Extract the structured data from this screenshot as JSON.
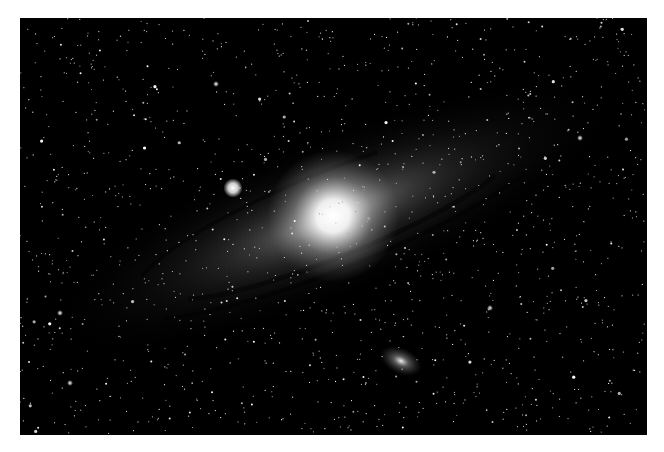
{
  "image": {
    "subject": "Andromeda Galaxy (M31) with satellite galaxies M32 and M110",
    "frame": {
      "x": 20,
      "y": 18,
      "width": 627,
      "height": 417,
      "background": "#ffffff",
      "sky": "#000000"
    },
    "galaxy": {
      "center": [
        313,
        198
      ],
      "angle_deg": -22,
      "core_radius": 22,
      "disk_rx": 300,
      "disk_ry": 78
    },
    "satellites": [
      {
        "name": "M32",
        "center": [
          213,
          170
        ],
        "radius": 6
      },
      {
        "name": "M110",
        "center": [
          381,
          343
        ],
        "rx": 22,
        "ry": 13,
        "angle_deg": 25
      }
    ],
    "star_count": 1400
  }
}
